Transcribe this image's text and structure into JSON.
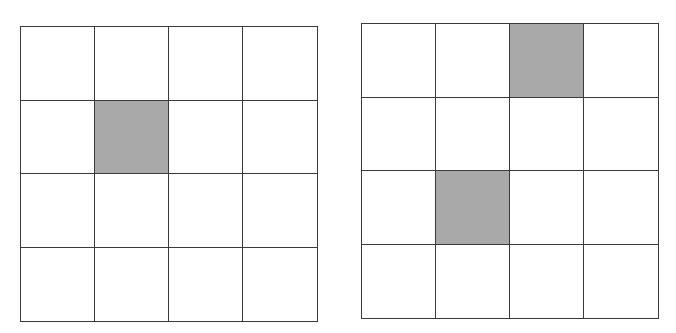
{
  "figure": {
    "type": "two 4x4 grids",
    "shade_color": "#a9a9a9",
    "line_color": "#3a3a3a"
  },
  "grids": [
    {
      "name": "left-grid",
      "rows": 4,
      "cols": 4,
      "box": {
        "left": 20,
        "top": 26,
        "width": 298,
        "height": 296
      },
      "shaded_cells": [
        [
          1,
          1
        ]
      ]
    },
    {
      "name": "right-grid",
      "rows": 4,
      "cols": 4,
      "box": {
        "left": 361,
        "top": 23,
        "width": 298,
        "height": 296
      },
      "shaded_cells": [
        [
          0,
          2
        ],
        [
          2,
          1
        ]
      ]
    }
  ]
}
